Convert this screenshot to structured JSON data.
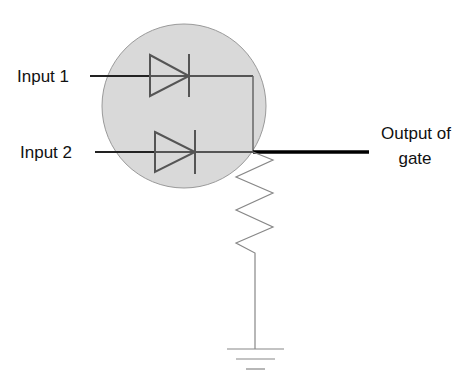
{
  "diagram": {
    "labels": {
      "input1": "Input 1",
      "input2": "Input 2",
      "output_line1": "Output of",
      "output_line2": "gate"
    },
    "components": [
      {
        "type": "diode",
        "name": "D1",
        "input": "Input 1"
      },
      {
        "type": "diode",
        "name": "D2",
        "input": "Input 2"
      },
      {
        "type": "resistor",
        "name": "R",
        "connects": [
          "output node",
          "ground"
        ]
      },
      {
        "type": "ground"
      }
    ],
    "colors": {
      "gate_fill": "#d9d9d9",
      "gate_outline": "#9a9a9a",
      "wire_inner": "#555555",
      "wire_input": "#222222",
      "wire_output": "#000000",
      "resistor": "#888888"
    }
  }
}
